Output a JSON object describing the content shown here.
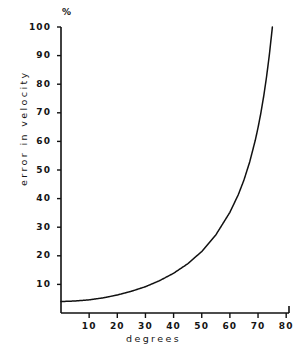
{
  "chart_data": {
    "type": "line",
    "title": "",
    "subtitle": "",
    "xlabel": "degrees",
    "ylabel": "error in velocity",
    "unit_symbol": "%",
    "xlim": [
      0,
      81
    ],
    "ylim": [
      0,
      100
    ],
    "xticks": [
      10,
      20,
      30,
      40,
      50,
      60,
      70,
      80
    ],
    "xtick_labels": [
      "10",
      "20",
      "30",
      "40",
      "50",
      "60",
      "70",
      "80"
    ],
    "yticks": [
      10,
      20,
      30,
      40,
      50,
      60,
      70,
      80,
      90,
      100
    ],
    "ytick_labels": [
      "10",
      "20",
      "30",
      "40",
      "50",
      "60",
      "70",
      "80",
      "90",
      "100"
    ],
    "grid": false,
    "legend": null,
    "series": [
      {
        "name": "error in velocity",
        "color": "#111111",
        "x": [
          0,
          5,
          10,
          15,
          20,
          25,
          30,
          35,
          40,
          45,
          50,
          55,
          60,
          63,
          65,
          67,
          69,
          70,
          71,
          72,
          73,
          74,
          75,
          76,
          77,
          78,
          79,
          79.5,
          80,
          80.3,
          80.6
        ],
        "y": [
          4.0,
          4.2,
          4.6,
          5.3,
          6.3,
          7.6,
          9.2,
          11.3,
          13.9,
          17.2,
          21.5,
          27.3,
          35.2,
          41.4,
          46.5,
          52.7,
          60.3,
          64.8,
          69.9,
          75.7,
          82.4,
          90.1,
          99.1,
          109.7,
          122.2,
          137.3,
          155.7,
          166.5,
          178.6,
          186.6,
          195.3
        ]
      }
    ]
  },
  "axes": {
    "x_axis_name": "horizontal-axis-line",
    "y_axis_name": "vertical-axis-line",
    "tick_direction_x": "down",
    "tick_direction_y": "left",
    "axis_color": "#111111",
    "background_color": "#ffffff"
  }
}
